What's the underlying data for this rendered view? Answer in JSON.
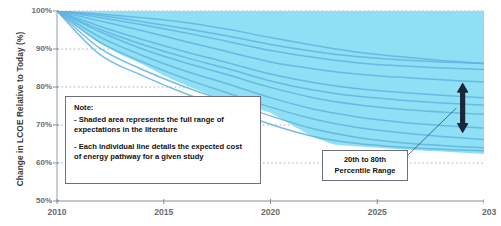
{
  "chart_data": {
    "type": "area",
    "title": "",
    "subtitle": "",
    "xlabel": "",
    "ylabel": "Change in LCOE  Relative to Today (%)",
    "xlim": [
      2010,
      2030
    ],
    "ylim": [
      50,
      100
    ],
    "grid": true,
    "grid_style": "dotted-horizontal",
    "legend": "none",
    "x_ticks": [
      {
        "value": 2010,
        "label": "2010"
      },
      {
        "value": 2015,
        "label": "2015"
      },
      {
        "value": 2020,
        "label": "2020"
      },
      {
        "value": 2025,
        "label": "2025"
      },
      {
        "value": 2030,
        "label": "203"
      }
    ],
    "y_ticks": [
      {
        "value": 100,
        "label": "100%"
      },
      {
        "value": 90,
        "label": "90%"
      },
      {
        "value": 80,
        "label": "80%"
      },
      {
        "value": 70,
        "label": "70%"
      },
      {
        "value": 60,
        "label": "60%"
      },
      {
        "value": 50,
        "label": "50%"
      }
    ],
    "band": {
      "name": "Full range of expectations in the literature",
      "fill_color": "#8fe0f5",
      "x": [
        2010,
        2011,
        2012,
        2013,
        2014,
        2015,
        2016,
        2017,
        2018,
        2019,
        2020,
        2021,
        2022,
        2023,
        2024,
        2025,
        2026,
        2027,
        2028,
        2029,
        2030
      ],
      "upper": [
        100,
        100,
        100,
        100,
        100,
        100,
        100,
        100,
        100,
        100,
        100,
        100,
        100,
        100,
        100,
        100,
        100,
        100,
        100,
        100,
        100
      ],
      "lower": [
        100,
        95.5,
        91.5,
        88.5,
        86.0,
        83.0,
        80.5,
        78.3,
        76.5,
        75.0,
        73.2,
        70.0,
        66.8,
        64.8,
        64.4,
        64.0,
        63.6,
        63.3,
        63.0,
        62.7,
        62.4
      ]
    },
    "series": [
      {
        "name": "pathway-1",
        "color": "#5fb3e0",
        "x": [
          2010,
          2012,
          2014,
          2016,
          2018,
          2020,
          2022,
          2024,
          2026,
          2028,
          2030
        ],
        "values": [
          100,
          99.2,
          98.2,
          97.0,
          95.2,
          93.0,
          91.0,
          89.2,
          88.0,
          87.0,
          86.2
        ]
      },
      {
        "name": "pathway-2",
        "color": "#5fb3e0",
        "x": [
          2010,
          2012,
          2014,
          2016,
          2018,
          2020,
          2022,
          2024,
          2026,
          2028,
          2030
        ],
        "values": [
          100,
          98.3,
          96.4,
          94.3,
          92.0,
          89.6,
          87.8,
          86.4,
          85.6,
          85.0,
          84.6
        ]
      },
      {
        "name": "pathway-3",
        "color": "#5fb3e0",
        "x": [
          2010,
          2012,
          2014,
          2016,
          2018,
          2020,
          2022,
          2024,
          2026,
          2028,
          2030
        ],
        "values": [
          100,
          97.4,
          94.8,
          92.0,
          89.3,
          86.6,
          84.8,
          83.4,
          82.6,
          81.9,
          81.3
        ]
      },
      {
        "name": "pathway-4",
        "color": "#5fb3e0",
        "x": [
          2010,
          2012,
          2014,
          2016,
          2018,
          2020,
          2022,
          2024,
          2026,
          2028,
          2030
        ],
        "values": [
          100,
          96.0,
          92.5,
          89.3,
          86.4,
          83.4,
          81.2,
          79.6,
          78.6,
          77.8,
          77.2
        ]
      },
      {
        "name": "pathway-5",
        "color": "#5fb3e0",
        "x": [
          2010,
          2012,
          2014,
          2016,
          2018,
          2020,
          2022,
          2024,
          2026,
          2028,
          2030
        ],
        "values": [
          100,
          94.6,
          90.0,
          86.4,
          83.2,
          79.9,
          77.2,
          75.4,
          74.2,
          73.4,
          72.8
        ]
      },
      {
        "name": "pathway-6",
        "color": "#5fb3e0",
        "x": [
          2010,
          2012,
          2014,
          2016,
          2018,
          2020,
          2022,
          2024,
          2026,
          2028,
          2030
        ],
        "values": [
          100,
          93.2,
          88.3,
          84.2,
          80.8,
          77.2,
          74.2,
          72.2,
          70.8,
          69.9,
          69.2
        ]
      },
      {
        "name": "pathway-7",
        "color": "#5fb3e0",
        "x": [
          2010,
          2012,
          2014,
          2016,
          2018,
          2020,
          2022,
          2024,
          2026,
          2028,
          2030
        ],
        "values": [
          100,
          91.8,
          86.6,
          82.2,
          78.4,
          74.7,
          71.6,
          69.4,
          68.0,
          67.0,
          66.2
        ]
      },
      {
        "name": "pathway-8",
        "color": "#5fb3e0",
        "x": [
          2010,
          2012,
          2014,
          2016,
          2018,
          2020,
          2022,
          2024,
          2026,
          2028,
          2030
        ],
        "values": [
          100,
          90.2,
          84.6,
          80.0,
          76.2,
          72.4,
          69.0,
          66.8,
          65.4,
          64.6,
          64.0
        ]
      },
      {
        "name": "pathway-9",
        "color": "#5fb3e0",
        "x": [
          2010,
          2012,
          2014,
          2016,
          2018,
          2020,
          2022,
          2024,
          2026,
          2028,
          2030
        ],
        "values": [
          100,
          88.6,
          83.0,
          78.3,
          74.4,
          70.2,
          67.0,
          65.2,
          64.2,
          63.6,
          63.2
        ]
      },
      {
        "name": "pathway-10",
        "color": "#5fb3e0",
        "x": [
          2010,
          2012,
          2014,
          2016,
          2018,
          2020,
          2022,
          2024,
          2026,
          2028,
          2030
        ],
        "values": [
          100,
          95.2,
          91.2,
          87.8,
          84.8,
          81.6,
          79.2,
          77.6,
          76.6,
          75.8,
          75.2
        ]
      },
      {
        "name": "pathway-11",
        "color": "#5fb3e0",
        "x": [
          2010,
          2012,
          2014,
          2016,
          2018,
          2020,
          2022,
          2024,
          2026,
          2028,
          2030
        ],
        "values": [
          100,
          98.8,
          97.2,
          95.4,
          93.4,
          91.2,
          89.4,
          88.0,
          87.2,
          86.6,
          86.2
        ]
      }
    ],
    "annotations": [
      {
        "name": "note-box",
        "title": "Note:",
        "lines": [
          "- Shaded area represents the full range of",
          "expectations in the literature",
          "- Each individual line details the expected cost",
          "of energy pathway  for a given study"
        ]
      },
      {
        "name": "percentile-callout",
        "lines": [
          "20th to 80th",
          "Percentile Range"
        ],
        "pointer": "double-headed vertical arrow near 2029"
      }
    ],
    "arrow": {
      "name": "percentile-range-arrow",
      "x_value": 2029,
      "y_top": 81,
      "y_bottom": 68,
      "color": "#1a2740"
    }
  },
  "axis_colors": {
    "tick_text": "#6b6b6b",
    "axis_line": "#8a8a9a",
    "grid_line": "#9a9aaa",
    "ylabel_text": "#3a3a3a"
  }
}
